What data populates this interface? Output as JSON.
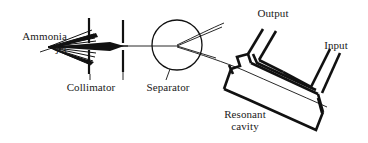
{
  "figure": {
    "width": 368,
    "height": 143,
    "background_color": "#ffffff",
    "ink_color": "#111111"
  },
  "labels": {
    "ammonia_line1": "Ammonia",
    "ammonia_line2": "jet",
    "collimator": "Collimator",
    "separator": "Separator",
    "output": "Output",
    "input": "Input",
    "resonant_line1": "Resonant",
    "resonant_line2": "cavity"
  },
  "components": [
    {
      "name": "ammonia-jet",
      "label": "Ammonia jet",
      "type": "source",
      "description": "Diverging fan of molecular trajectories emitted from a nozzle at the left",
      "origin": {
        "x": 47,
        "y": 47
      },
      "ray_count": 9
    },
    {
      "name": "collimator",
      "label": "Collimator",
      "type": "aperture-plates",
      "description": "Two vertical plates each with a central gap that narrows the beam",
      "plates": [
        {
          "x": 89,
          "y_top": 18,
          "y_bottom": 74,
          "gap_top": 44,
          "gap_bottom": 50
        },
        {
          "x": 123,
          "y_top": 20,
          "y_bottom": 72,
          "gap_top": 44,
          "gap_bottom": 50
        }
      ]
    },
    {
      "name": "separator",
      "label": "Separator",
      "type": "circle",
      "description": "Circular state selector where the beam splits into two diverging paths",
      "center": {
        "x": 177,
        "y": 45
      },
      "radius": 25
    },
    {
      "name": "resonant-cavity",
      "label": "Resonant cavity",
      "type": "tilted-rectangular-chamber",
      "description": "Tilted rectangular cavity the selected beam traverses diagonally"
    },
    {
      "name": "output-waveguide",
      "label": "Output",
      "type": "waveguide",
      "description": "Angled waveguide arm leaving the top of the cavity"
    },
    {
      "name": "input-waveguide",
      "label": "Input",
      "type": "waveguide",
      "description": "Angled waveguide arm entering at the right of the cavity"
    },
    {
      "name": "molecular-beam",
      "label": "",
      "type": "trajectory",
      "description": "Curved beam path from separator through the cavity and out to the lower right"
    }
  ]
}
